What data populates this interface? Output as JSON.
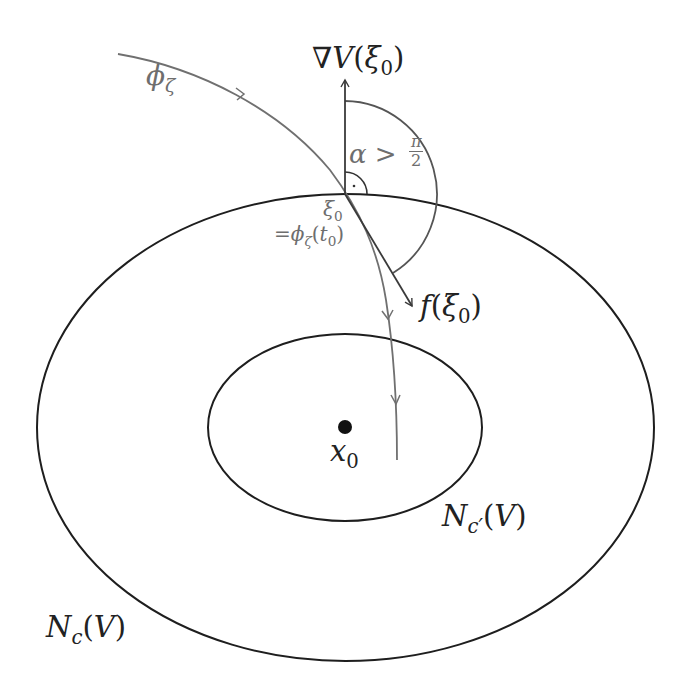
{
  "diagram": {
    "type": "level-set-trajectory-diagram",
    "colors": {
      "level_sets": "#1e1e1e",
      "trajectory": "#707070",
      "vectors": "#3a3a3a",
      "angle_arc": "#555555",
      "labels_gray": "#6e6e6e",
      "labels_black": "#222222"
    },
    "labels": {
      "gradient": {
        "nabla": "∇",
        "V": "V",
        "open": "(",
        "xi": "ξ",
        "sub": "0",
        "close": ")"
      },
      "trajectory": {
        "phi": "ϕ",
        "sub": "ζ"
      },
      "angle": {
        "alpha": "α",
        "gt": " > ",
        "num": "π",
        "den": "2"
      },
      "point": {
        "xi": "ξ",
        "sub": "0"
      },
      "point_eq": {
        "eq": "=",
        "phi": "ϕ",
        "sub": "ζ",
        "open": "(",
        "t": "t",
        "tsub": "0",
        "close": ")"
      },
      "field": {
        "f": "f",
        "open": "(",
        "xi": "ξ",
        "sub": "0",
        "close": ")"
      },
      "equilibrium": {
        "x": "x",
        "sub": "0"
      },
      "inner_set": {
        "N": "N",
        "sub": "c′",
        "open": "(",
        "V": "V",
        "close": ")"
      },
      "outer_set": {
        "N": "N",
        "sub": "c",
        "open": "(",
        "V": "V",
        "close": ")"
      }
    },
    "geometry": {
      "outer_ellipse": {
        "cx": 345.5,
        "cy": 427.5,
        "rx": 308.5,
        "ry": 233.5
      },
      "inner_ellipse": {
        "cx": 345,
        "cy": 427.5,
        "rx": 137,
        "ry": 93.5
      },
      "xi0": [
        345,
        194
      ],
      "x0": [
        345,
        427
      ],
      "gradient_tip": [
        345,
        80
      ],
      "f_tip": [
        412,
        306
      ]
    }
  }
}
